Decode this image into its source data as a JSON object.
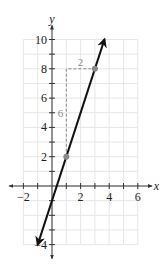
{
  "chart_data": {
    "type": "line",
    "title": "",
    "xlabel": "x",
    "ylabel": "y",
    "xlim": [
      -2,
      6
    ],
    "ylim": [
      -4,
      10
    ],
    "grid": true,
    "x_ticks": [
      -2,
      -1,
      0,
      1,
      2,
      3,
      4,
      5,
      6
    ],
    "y_ticks": [
      -4,
      -3,
      -2,
      -1,
      0,
      1,
      2,
      3,
      4,
      5,
      6,
      7,
      8,
      9,
      10
    ],
    "x_tick_labels": [
      {
        "value": -2,
        "label": "−2"
      },
      {
        "value": 2,
        "label": "2"
      },
      {
        "value": 4,
        "label": "4"
      },
      {
        "value": 6,
        "label": "6"
      }
    ],
    "y_tick_labels": [
      {
        "value": -4,
        "label": "−4"
      },
      {
        "value": 2,
        "label": "2"
      },
      {
        "value": 4,
        "label": "4"
      },
      {
        "value": 6,
        "label": "6"
      },
      {
        "value": 8,
        "label": "8"
      },
      {
        "value": 10,
        "label": "10"
      }
    ],
    "series": [
      {
        "name": "y = 3x − 1",
        "slope": 3,
        "intercept": -1,
        "x_range": [
          -1,
          3.67
        ],
        "arrows": "both",
        "color": "#111111"
      }
    ],
    "points": [
      {
        "x": 1,
        "y": 2,
        "color": "#8a8a8a"
      },
      {
        "x": 3,
        "y": 8,
        "color": "#8a8a8a"
      }
    ],
    "slope_triangle": {
      "from": {
        "x": 1,
        "y": 2
      },
      "corner": {
        "x": 1,
        "y": 8
      },
      "to": {
        "x": 3,
        "y": 8
      },
      "rise_label": "6",
      "run_label": "2",
      "color": "#8a8a8a"
    },
    "colors": {
      "grid": "#e6e6e6",
      "axis": "#333333",
      "line": "#111111",
      "annotation": "#8a8a8a"
    }
  }
}
